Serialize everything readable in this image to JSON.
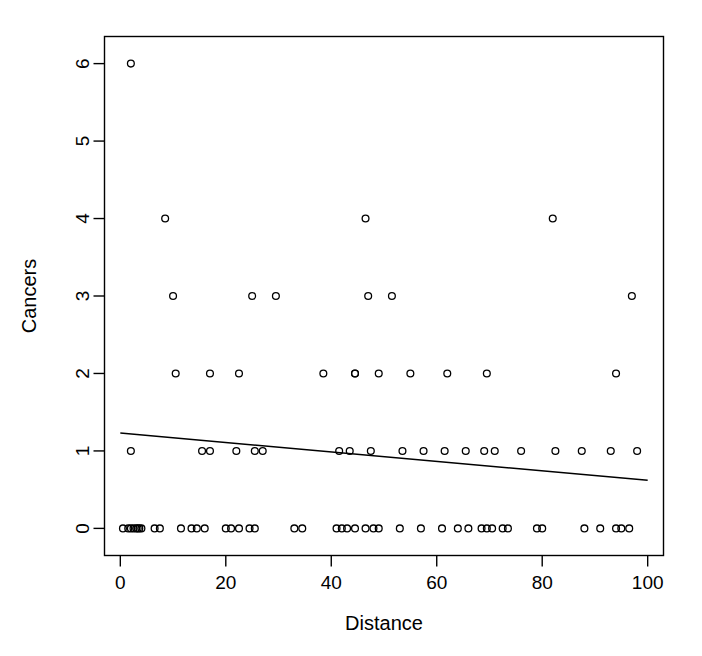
{
  "chart_data": {
    "type": "scatter",
    "title": "",
    "xlabel": "Distance",
    "ylabel": "Cancers",
    "xlim": [
      -3,
      103
    ],
    "ylim": [
      -0.35,
      6.35
    ],
    "xticks": [
      0,
      20,
      40,
      60,
      80,
      100
    ],
    "yticks": [
      0,
      1,
      2,
      3,
      4,
      5,
      6
    ],
    "grid": false,
    "legend": null,
    "marker": "open-circle",
    "point_color": "#000000",
    "line_color": "#000000",
    "background": "#ffffff",
    "frame": true,
    "series": [
      {
        "name": "observations",
        "x": [
          2.0,
          0.5,
          1.5,
          2.5,
          3.0,
          3.3,
          3.6,
          4.0,
          6.5,
          7.5,
          11.5,
          13.5,
          14.5,
          16.0,
          20.0,
          21.0,
          22.5,
          24.5,
          25.5,
          33.0,
          34.5,
          41.0,
          42.0,
          43.0,
          44.5,
          46.5,
          48.0,
          49.0,
          53.0,
          57.0,
          61.0,
          64.0,
          66.0,
          68.5,
          69.5,
          70.5,
          72.5,
          73.5,
          79.0,
          80.0,
          88.0,
          91.0,
          94.0,
          95.0,
          96.5,
          2.0,
          15.5,
          17.0,
          22.0,
          25.5,
          27.0,
          41.5,
          43.5,
          47.5,
          53.5,
          57.5,
          61.5,
          65.5,
          69.0,
          71.0,
          76.0,
          82.5,
          87.5,
          93.0,
          98.0,
          10.5,
          17.0,
          22.5,
          38.5,
          44.5,
          44.5,
          49.0,
          55.0,
          62.0,
          69.5,
          94.0,
          10.0,
          25.0,
          29.5,
          47.0,
          51.5,
          97.0,
          8.5,
          46.5,
          82.0,
          2.0
        ],
        "y": [
          0,
          0,
          0,
          0,
          0,
          0,
          0,
          0,
          0,
          0,
          0,
          0,
          0,
          0,
          0,
          0,
          0,
          0,
          0,
          0,
          0,
          0,
          0,
          0,
          0,
          0,
          0,
          0,
          0,
          0,
          0,
          0,
          0,
          0,
          0,
          0,
          0,
          0,
          0,
          0,
          0,
          0,
          0,
          0,
          0,
          1,
          1,
          1,
          1,
          1,
          1,
          1,
          1,
          1,
          1,
          1,
          1,
          1,
          1,
          1,
          1,
          1,
          1,
          1,
          1,
          2,
          2,
          2,
          2,
          2,
          2,
          2,
          2,
          2,
          2,
          2,
          3,
          3,
          3,
          3,
          3,
          3,
          4,
          4,
          4,
          6
        ]
      }
    ],
    "fit_line": {
      "name": "regression-line",
      "x": [
        0,
        100
      ],
      "y": [
        1.23,
        0.62
      ],
      "slope": -0.0061,
      "intercept": 1.23
    }
  },
  "axes": {
    "x_title": "Distance",
    "y_title": "Cancers",
    "x_tick_labels": [
      "0",
      "20",
      "40",
      "60",
      "80",
      "100"
    ],
    "y_tick_labels": [
      "0",
      "1",
      "2",
      "3",
      "4",
      "5",
      "6"
    ]
  }
}
